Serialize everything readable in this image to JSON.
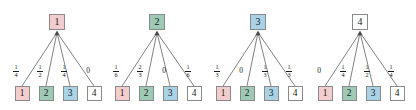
{
  "figure": {
    "type": "transition-probability-trees",
    "node_palette": {
      "state1": "#f3cdcd",
      "state2": "#9ec9b4",
      "state3": "#a9d2e6",
      "state4": "#ffffff",
      "border": "#8a8a8a",
      "edge": "#4a4a4a",
      "text": "#1a1a1a"
    },
    "child_labels": [
      "1",
      "2",
      "3",
      "4"
    ],
    "child_colors": [
      "#f3cdcd",
      "#9ec9b4",
      "#a9d2e6",
      "#ffffff"
    ],
    "groups": [
      {
        "root_label": "1",
        "root_color": "#f3cdcd",
        "weights": [
          {
            "num": "1",
            "den": "4",
            "display": "1/4"
          },
          {
            "num": "1",
            "den": "2",
            "display": "1/2"
          },
          {
            "num": "1",
            "den": "4",
            "display": "1/4"
          },
          {
            "whole": "0",
            "display": "0"
          }
        ]
      },
      {
        "root_label": "2",
        "root_color": "#9ec9b4",
        "weights": [
          {
            "num": "1",
            "den": "6",
            "display": "1/6"
          },
          {
            "num": "2",
            "den": "3",
            "display": "2/3"
          },
          {
            "whole": "0",
            "display": "0"
          },
          {
            "num": "1",
            "den": "6",
            "display": "1/6"
          }
        ]
      },
      {
        "root_label": "3",
        "root_color": "#a9d2e6",
        "weights": [
          {
            "num": "1",
            "den": "3",
            "display": "1/3"
          },
          {
            "whole": "0",
            "display": "0"
          },
          {
            "num": "1",
            "den": "3",
            "display": "1/3"
          },
          {
            "num": "1",
            "den": "3",
            "display": "1/3"
          }
        ]
      },
      {
        "root_label": "4",
        "root_color": "#ffffff",
        "weights": [
          {
            "whole": "0",
            "display": "0"
          },
          {
            "num": "1",
            "den": "4",
            "display": "1/4"
          },
          {
            "num": "1",
            "den": "2",
            "display": "1/2"
          },
          {
            "num": "1",
            "den": "4",
            "display": "1/4"
          }
        ]
      }
    ]
  },
  "chart_data": {
    "type": "diagram",
    "title": "",
    "states": [
      "1",
      "2",
      "3",
      "4"
    ],
    "matrix": [
      [
        0.25,
        0.5,
        0.25,
        0
      ],
      [
        0.1667,
        0.6667,
        0,
        0.1667
      ],
      [
        0.3333,
        0,
        0.3333,
        0.3333
      ],
      [
        0,
        0.25,
        0.5,
        0.25
      ]
    ],
    "matrix_display": [
      [
        "1/4",
        "1/2",
        "1/4",
        "0"
      ],
      [
        "1/6",
        "2/3",
        "0",
        "1/6"
      ],
      [
        "1/3",
        "0",
        "1/3",
        "1/3"
      ],
      [
        "0",
        "1/4",
        "1/2",
        "1/4"
      ]
    ]
  }
}
